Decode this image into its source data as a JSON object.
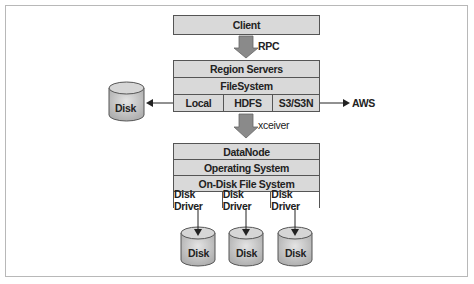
{
  "client": {
    "label": "Client"
  },
  "rpc_arrow": {
    "label": "RPC"
  },
  "region_stack": {
    "rows": [
      {
        "cells": [
          "Region Servers"
        ]
      },
      {
        "cells": [
          "FileSystem"
        ]
      },
      {
        "cells": [
          "Local",
          "HDFS",
          "S3/S3N"
        ]
      }
    ]
  },
  "left_disk": {
    "label": "Disk"
  },
  "aws": {
    "label": "AWS"
  },
  "xceiver_arrow": {
    "label": "xceiver"
  },
  "datanode_stack": {
    "rows": [
      {
        "cells": [
          "DataNode"
        ]
      },
      {
        "cells": [
          "Operating System"
        ]
      },
      {
        "cells": [
          "On-Disk File System"
        ]
      },
      {
        "cells": [
          "Disk Driver",
          "Disk Driver",
          "Disk Driver"
        ]
      }
    ]
  },
  "bottom_disks": [
    {
      "label": "Disk"
    },
    {
      "label": "Disk"
    },
    {
      "label": "Disk"
    }
  ],
  "colors": {
    "box_fill": "#d9d9d9",
    "border": "#555555",
    "arrow_fill": "#8a8a8a"
  }
}
